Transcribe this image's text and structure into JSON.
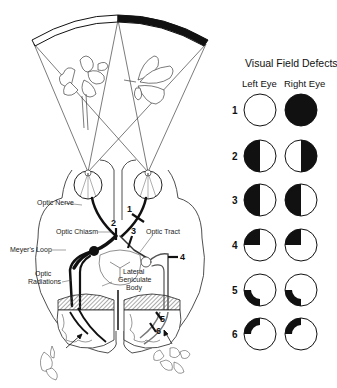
{
  "left_diagram": {
    "labels": {
      "optic_nerve": "Optic Nerve",
      "optic_chiasm": "Optic Chiasm",
      "optic_tract": "Optic Tract",
      "meyers_loop": "Meyer's Loop",
      "optic_radiations_1": "Optic",
      "optic_radiations_2": "Radiations",
      "lgb_1": "Lateral",
      "lgb_2": "Geniculate",
      "lgb_3": "Body"
    },
    "lesion_markers": [
      "1",
      "2",
      "3",
      "4",
      "5",
      "6"
    ],
    "visual_field_bar": {
      "left_half": "white",
      "right_half": "black"
    },
    "objects": [
      "flower-left-field",
      "butterfly-right-field"
    ]
  },
  "right_panel": {
    "title": "Visual Field Defects",
    "columns": [
      "Left Eye",
      "Right Eye"
    ],
    "rows": [
      {
        "num": "1",
        "left": "normal",
        "right": "total-blindness"
      },
      {
        "num": "2",
        "left": "temporal-hemianopia-left",
        "right": "temporal-hemianopia-right"
      },
      {
        "num": "3",
        "left": "left-homonymous-hemianopia",
        "right": "left-homonymous-hemianopia"
      },
      {
        "num": "4",
        "left": "upper-left-quadrantanopia",
        "right": "upper-left-quadrantanopia"
      },
      {
        "num": "5",
        "left": "lower-left-quadrant-macular-sparing",
        "right": "lower-left-quadrant-macular-sparing"
      },
      {
        "num": "6",
        "left": "upper-left-quadrant-macular-sparing",
        "right": "upper-left-quadrant-macular-sparing"
      }
    ]
  },
  "colors": {
    "ink": "#111111",
    "background": "#ffffff",
    "hatch": "#777777"
  }
}
